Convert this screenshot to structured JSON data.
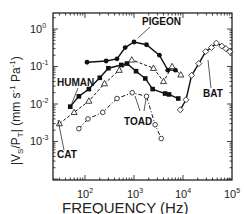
{
  "chart_data": {
    "type": "line",
    "title": "",
    "xlabel": "FREQUENCY (Hz)",
    "ylabel": "|VS/PT| (mm s-1 Pa-1)",
    "xscale": "log",
    "yscale": "log",
    "xlim": [
      22,
      100000
    ],
    "ylim": [
      6e-05,
      2.5
    ],
    "x_ticks": [
      "10^2",
      "10^3",
      "10^4",
      "10^5"
    ],
    "y_ticks": [
      "10^0",
      "10^-1",
      "10^-2",
      "10^-3"
    ],
    "grid": false,
    "legend": "inline labels",
    "series": [
      {
        "name": "PIGEON",
        "marker": "filled-circle",
        "line": "solid",
        "x": [
          110,
          270,
          450,
          660,
          1000,
          1800,
          3300,
          4900,
          7000
        ],
        "y": [
          0.13,
          0.14,
          0.16,
          0.32,
          0.45,
          0.38,
          0.2,
          0.08,
          0.08
        ]
      },
      {
        "name": "HUMAN",
        "marker": "filled-square",
        "line": "solid",
        "x": [
          50,
          75,
          120,
          200,
          300,
          550,
          720,
          1100,
          1700,
          2400,
          4300,
          5200,
          8000
        ],
        "y": [
          0.0085,
          0.016,
          0.025,
          0.05,
          0.09,
          0.11,
          0.12,
          0.075,
          0.048,
          0.025,
          0.019,
          0.018,
          0.014
        ]
      },
      {
        "name": "CAT",
        "marker": "open-triangle",
        "line": "dashed",
        "x": [
          30,
          60,
          120,
          250,
          500,
          900,
          2500,
          4000,
          6000,
          9000
        ],
        "y": [
          0.003,
          0.006,
          0.012,
          0.035,
          0.08,
          0.15,
          0.09,
          0.04,
          0.1,
          0.06
        ]
      },
      {
        "name": "TOAD",
        "marker": "open-circle",
        "line": "dash-dot",
        "x": [
          75,
          115,
          230,
          450,
          920,
          1800,
          2700,
          3600
        ],
        "y": [
          0.0022,
          0.004,
          0.006,
          0.014,
          0.02,
          0.016,
          0.0028,
          0.0012
        ]
      },
      {
        "name": "BAT",
        "marker": "open-diamond",
        "line": "solid",
        "x": [
          8800,
          11500,
          15000,
          21000,
          29000,
          38000,
          48000,
          62000,
          75000,
          90000
        ],
        "y": [
          0.007,
          0.013,
          0.058,
          0.12,
          0.25,
          0.32,
          0.42,
          0.35,
          0.3,
          0.25
        ]
      }
    ],
    "annotations": [
      "PIGEON",
      "HUMAN",
      "CAT",
      "TOAD",
      "BAT"
    ]
  },
  "labels": {
    "x_axis_title": "FREQUENCY (Hz)",
    "y_axis_title_main": "|V",
    "y_axis_sub_s": "S",
    "y_axis_mid": "/P",
    "y_axis_sub_t": "T",
    "y_axis_rest": "| (mm s",
    "y_axis_exp1": "-1",
    "y_axis_pa": " Pa",
    "y_axis_exp2": "-1",
    "y_axis_close": ")",
    "x_tick_base": "10",
    "x_tick_exps": [
      "2",
      "3",
      "4",
      "5"
    ],
    "y_tick_base": "10",
    "y_tick_exps": [
      "0",
      "-1",
      "-2",
      "-3"
    ],
    "series_labels": {
      "pigeon": "PIGEON",
      "human": "HUMAN",
      "cat": "CAT",
      "toad": "TOAD",
      "bat": "BAT"
    }
  }
}
